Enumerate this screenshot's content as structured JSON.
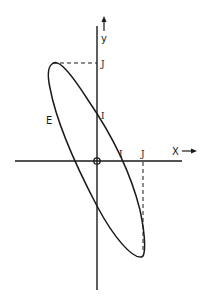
{
  "diagram": {
    "type": "ellipse-in-cartesian-axes",
    "axes": {
      "x_label": "X",
      "x_arrow": "→",
      "y_label": "y",
      "y_arrow": "↑"
    },
    "curve_label": "E",
    "intercepts": {
      "y_axis_intercept_label": "I",
      "x_axis_intercept_label": "I"
    },
    "extremes": {
      "y_max_label": "J",
      "x_max_label": "J"
    },
    "colors": {
      "ink": "#1a1a1a",
      "background": "#ffffff"
    }
  }
}
